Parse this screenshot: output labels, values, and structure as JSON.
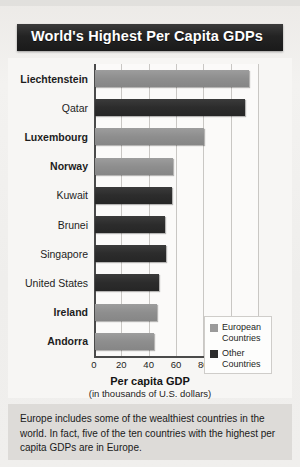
{
  "banner": {
    "title": "World's Highest Per Capita GDPs"
  },
  "legend": {
    "items": [
      {
        "label": "European Countries",
        "color": "#9a9a9a",
        "key": "european"
      },
      {
        "label": "Other Countries",
        "color": "#2b2b2b",
        "key": "other"
      }
    ]
  },
  "caption": {
    "text": "Europe includes some of the wealthiest countries in the world. In fact, five of the ten countries with the highest per capita GDPs are in Europe."
  },
  "chart_data": {
    "type": "bar",
    "orientation": "horizontal",
    "title": "World's Highest Per Capita GDPs",
    "xlabel": "Per capita GDP",
    "xlabel_sub": "(in thousands of U.S. dollars)",
    "ylabel": "",
    "xlim": [
      0,
      120
    ],
    "xticks": [
      0,
      20,
      40,
      60,
      80,
      100,
      120
    ],
    "xtick_labels": [
      "0",
      "20",
      "40",
      "60",
      "80",
      "100",
      "120"
    ],
    "grid": true,
    "legend_position": "inner-right",
    "categories": [
      "Liechtenstein",
      "Qatar",
      "Luxembourg",
      "Norway",
      "Kuwait",
      "Brunei",
      "Singapore",
      "United States",
      "Ireland",
      "Andorra"
    ],
    "values": [
      113,
      110,
      80,
      57,
      56,
      51,
      52,
      47,
      45,
      43
    ],
    "groups": [
      "european",
      "other",
      "european",
      "european",
      "other",
      "other",
      "other",
      "other",
      "european",
      "european"
    ],
    "series": [
      {
        "name": "European Countries",
        "color": "#9a9a9a"
      },
      {
        "name": "Other Countries",
        "color": "#2b2b2b"
      }
    ]
  }
}
